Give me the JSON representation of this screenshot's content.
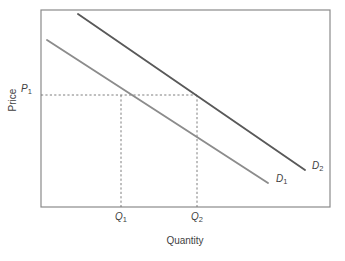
{
  "chart_data": {
    "type": "line",
    "title": "",
    "xlabel": "Quantity",
    "ylabel": "Price",
    "grid": false,
    "legend": "inline-curve-labels",
    "axis_box": {
      "left": 41,
      "right": 330,
      "top": 10,
      "bottom": 207
    },
    "xlim": [
      0,
      100
    ],
    "ylim": [
      0,
      100
    ],
    "series": [
      {
        "name": "D1",
        "label": "D",
        "subscript": "1",
        "color": "#8c8c8c",
        "points": [
          {
            "x": 47,
            "y": 40
          },
          {
            "x": 268,
            "y": 183
          }
        ],
        "label_pos": {
          "x": 276,
          "y": 174
        }
      },
      {
        "name": "D2",
        "label": "D",
        "subscript": "2",
        "color": "#595959",
        "points": [
          {
            "x": 78,
            "y": 14
          },
          {
            "x": 305,
            "y": 170
          }
        ],
        "label_pos": {
          "x": 312,
          "y": 161
        }
      }
    ],
    "annotations": [
      {
        "name": "price-level",
        "label": "P",
        "subscript": "1",
        "type": "horizontal-dashed",
        "y": 95,
        "from_x": 41,
        "to_x": 197
      },
      {
        "name": "quantity-1",
        "label": "Q",
        "subscript": "1",
        "type": "vertical-dashed",
        "x": 121,
        "from_y": 95,
        "to_y": 207
      },
      {
        "name": "quantity-2",
        "label": "Q",
        "subscript": "2",
        "type": "vertical-dashed",
        "x": 197,
        "from_y": 95,
        "to_y": 207
      }
    ],
    "tick_labels": {
      "y": [
        "P1"
      ],
      "x": [
        "Q1",
        "Q2"
      ]
    }
  },
  "axes": {
    "y_label": "Price",
    "x_label": "Quantity"
  },
  "ticks": {
    "price_1": {
      "base": "P",
      "sub": "1"
    },
    "quantity_1": {
      "base": "Q",
      "sub": "1"
    },
    "quantity_2": {
      "base": "Q",
      "sub": "2"
    }
  },
  "curves": {
    "d1": {
      "base": "D",
      "sub": "1"
    },
    "d2": {
      "base": "D",
      "sub": "2"
    }
  },
  "colors": {
    "curve_d1": "#8c8c8c",
    "curve_d2": "#595959",
    "axis": "#8a8a8a",
    "dashed": "#6f6f6f",
    "text": "#3f3f3f",
    "background": "#ffffff"
  }
}
